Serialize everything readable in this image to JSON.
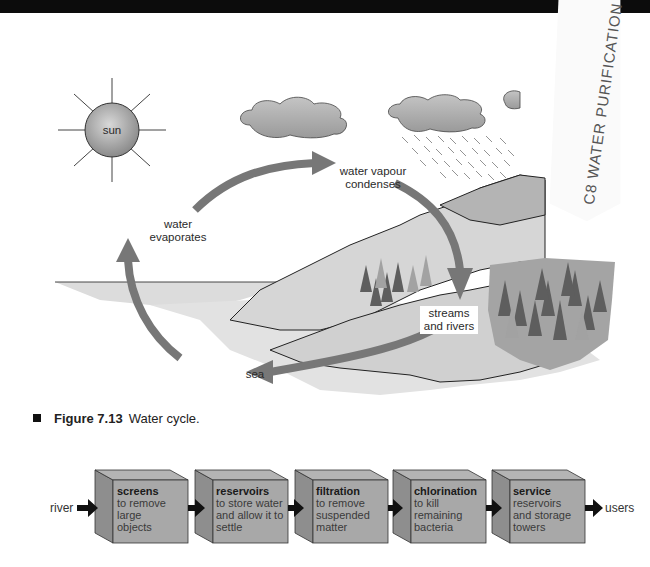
{
  "figure": {
    "number_label": "Figure 7.13",
    "title": "Water cycle."
  },
  "water_cycle": {
    "labels": {
      "sun": "sun",
      "evaporates": [
        "water",
        "evaporates"
      ],
      "condenses": [
        "water vapour",
        "condenses"
      ],
      "streams": [
        "streams",
        "and rivers"
      ],
      "sea": "sea"
    }
  },
  "handwritten_note": "C8 WATER PURIFICATION",
  "purification_flow": {
    "input": "river",
    "output": "users",
    "steps": [
      {
        "title": "screens",
        "desc": [
          "to remove",
          "large",
          "objects"
        ]
      },
      {
        "title": "reservoirs",
        "desc": [
          "to store water",
          "and allow it to",
          "settle"
        ]
      },
      {
        "title": "filtration",
        "desc": [
          "to remove",
          "suspended",
          "matter"
        ]
      },
      {
        "title": "chlorination",
        "desc": [
          "to kill",
          "remaining",
          "bacteria"
        ]
      },
      {
        "title": "service",
        "desc": [
          "reservoirs",
          "and storage",
          "towers"
        ]
      }
    ]
  },
  "colors": {
    "arrow": "#777777",
    "box_front": "#a8a8a8",
    "box_side": "#8e8e8e",
    "land": "#d4d4d4",
    "sea": "#dedede"
  }
}
